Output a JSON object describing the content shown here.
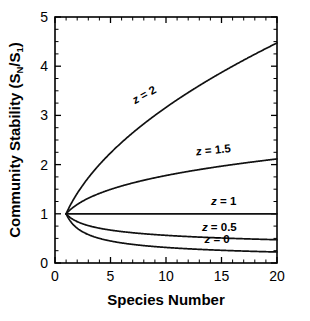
{
  "figure": {
    "background_color": "#ffffff",
    "line_color": "#111111",
    "axis_color": "#000000",
    "faint_top_text": "",
    "x_axis": {
      "title": "Species Number",
      "min": 0,
      "max": 20,
      "major_ticks": [
        0,
        5,
        10,
        15,
        20
      ],
      "major_tick_labels": [
        "0",
        "5",
        "10",
        "15",
        "20"
      ],
      "minor_tick_interval": 1
    },
    "y_axis": {
      "title_main": "Community Stability (S",
      "title_sub1": "N",
      "title_mid": "/S",
      "title_sub2": "1",
      "title_end": ")",
      "title_plain": "Community Stability (SN/S1)",
      "min": 0,
      "max": 5,
      "major_ticks": [
        0,
        1,
        2,
        3,
        4,
        5
      ],
      "major_tick_labels": [
        "0",
        "1",
        "2",
        "3",
        "4",
        "5"
      ],
      "minor_tick_interval": 0.25
    }
  },
  "chart_data": {
    "type": "line",
    "title": "",
    "subtitle": "",
    "xlabel": "Species Number",
    "ylabel": "Community Stability (SN/S1)",
    "xlim": [
      0,
      20
    ],
    "ylim": [
      0,
      5
    ],
    "grid": false,
    "legend_position": "inline-curve-labels",
    "x": [
      1,
      2,
      3,
      4,
      5,
      6,
      7,
      8,
      9,
      10,
      11,
      12,
      13,
      14,
      15,
      16,
      17,
      18,
      19,
      20
    ],
    "series": [
      {
        "name": "z = 2",
        "label": "z = 2",
        "z": 2,
        "label_x": 8.2,
        "label_y": 3.35,
        "label_rotation": -29,
        "values": [
          1.0,
          1.414,
          1.732,
          2.0,
          2.236,
          2.449,
          2.646,
          2.828,
          3.0,
          3.162,
          3.317,
          3.464,
          3.606,
          3.742,
          3.873,
          4.0,
          4.123,
          4.243,
          4.359,
          4.472
        ]
      },
      {
        "name": "z = 1.5",
        "label": "z = 1.5",
        "z": 1.5,
        "label_x": 14.3,
        "label_y": 2.22,
        "label_rotation": -6,
        "values": [
          1.0,
          1.189,
          1.316,
          1.414,
          1.495,
          1.565,
          1.627,
          1.682,
          1.732,
          1.778,
          1.821,
          1.861,
          1.899,
          1.934,
          1.968,
          2.0,
          2.031,
          2.06,
          2.088,
          2.115
        ]
      },
      {
        "name": "z = 1",
        "label": "z = 1",
        "z": 1,
        "label_x": 15.2,
        "label_y": 1.17,
        "label_rotation": 0,
        "values": [
          1.0,
          1.0,
          1.0,
          1.0,
          1.0,
          1.0,
          1.0,
          1.0,
          1.0,
          1.0,
          1.0,
          1.0,
          1.0,
          1.0,
          1.0,
          1.0,
          1.0,
          1.0,
          1.0,
          1.0
        ]
      },
      {
        "name": "z = 0.5",
        "label": "z = 0.5",
        "z": 0.5,
        "label_x": 14.8,
        "label_y": 0.66,
        "label_rotation": 0,
        "values": [
          1.0,
          0.917,
          0.872,
          0.841,
          0.818,
          0.799,
          0.784,
          0.771,
          0.76,
          0.75,
          0.741,
          0.733,
          0.726,
          0.719,
          0.713,
          0.707,
          0.702,
          0.697,
          0.693,
          0.688
        ]
      },
      {
        "name": "z = 0",
        "label": "z = 0",
        "z": 0,
        "label_x": 14.6,
        "label_y": 0.4,
        "label_rotation": 0,
        "values": [
          1.0,
          0.707,
          0.577,
          0.5,
          0.447,
          0.408,
          0.378,
          0.354,
          0.333,
          0.316,
          0.302,
          0.289,
          0.277,
          0.267,
          0.258,
          0.25,
          0.243,
          0.236,
          0.229,
          0.224
        ]
      }
    ]
  }
}
